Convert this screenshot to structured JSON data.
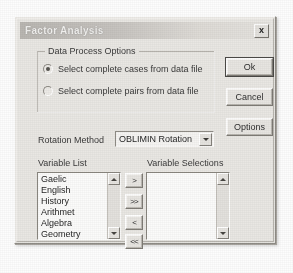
{
  "window": {
    "title": "Factor Analysis",
    "close_label": "x"
  },
  "group": {
    "title": "Data Process Options",
    "options": [
      {
        "label": "Select complete cases from data file",
        "selected": true
      },
      {
        "label": "Select complete pairs from data file",
        "selected": false
      }
    ]
  },
  "buttons": {
    "ok": "Ok",
    "cancel": "Cancel",
    "options": "Options"
  },
  "rotation": {
    "label": "Rotation Method",
    "value": "OBLIMIN Rotation"
  },
  "variable_list": {
    "caption": "Variable List",
    "items": [
      "Gaelic",
      "English",
      "History",
      "Arithmet",
      "Algebra",
      "Geometry"
    ]
  },
  "variable_selections": {
    "caption": "Variable Selections",
    "items": []
  },
  "transfer": {
    "add": ">",
    "add_all": ">>",
    "remove": "<",
    "remove_all": "<<"
  },
  "colors": {
    "dialog_face": "#e9e7e3",
    "title_bar": "#c6c3bf",
    "title_text": "#f2f1ef",
    "field_bg": "#fbfbfa",
    "text": "#272727"
  }
}
